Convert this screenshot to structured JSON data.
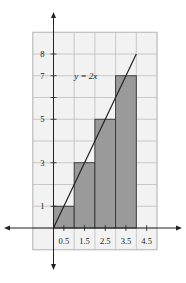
{
  "chart_data": {
    "type": "bar",
    "title": "",
    "xlabel": "",
    "ylabel": "",
    "xlim": [
      -1,
      5
    ],
    "ylim": [
      -1,
      10
    ],
    "grid": true,
    "bars": [
      {
        "x0": 0,
        "x1": 1,
        "height": 1
      },
      {
        "x0": 1,
        "x1": 2,
        "height": 3
      },
      {
        "x0": 2,
        "x1": 3,
        "height": 5
      },
      {
        "x0": 3,
        "x1": 4,
        "height": 7
      }
    ],
    "line": {
      "label": "y = 2x",
      "points": [
        [
          0,
          0
        ],
        [
          4,
          8
        ]
      ]
    },
    "x_ticks": [
      {
        "value": 0.5,
        "label": "0.5"
      },
      {
        "value": 1.5,
        "label": "1.5"
      },
      {
        "value": 2.5,
        "label": "2.5"
      },
      {
        "value": 3.5,
        "label": "3.5"
      },
      {
        "value": 4.5,
        "label": "4.5"
      }
    ],
    "y_ticks": [
      {
        "value": 1,
        "label": "1"
      },
      {
        "value": 3,
        "label": "3"
      },
      {
        "value": 5,
        "label": "5"
      },
      {
        "value": 6,
        "label": ""
      },
      {
        "value": 7,
        "label": "7"
      },
      {
        "value": 8,
        "label": "8"
      }
    ],
    "colors": {
      "bar_fill": "#9a9a9a",
      "grid_bg": "#f2f2f2",
      "grid_line": "#bdbdbd"
    }
  }
}
